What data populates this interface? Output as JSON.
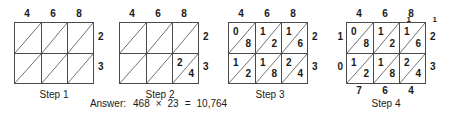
{
  "problem": {
    "multiplicand": "468",
    "multiplier": "23",
    "product": "10,764",
    "operator": "×",
    "equals": "="
  },
  "answer": {
    "label": "Answer:",
    "left": "468",
    "operator": "×",
    "right": "23",
    "equals": "=",
    "result": "10,764"
  },
  "steps": [
    {
      "caption": "Step 1",
      "top_digits": [
        "4",
        "6",
        "8"
      ],
      "right_digits": [
        "2",
        "3"
      ],
      "cells": [
        [
          {
            "upper": "",
            "lower": ""
          },
          {
            "upper": "",
            "lower": ""
          },
          {
            "upper": "",
            "lower": ""
          }
        ],
        [
          {
            "upper": "",
            "lower": ""
          },
          {
            "upper": "",
            "lower": ""
          },
          {
            "upper": "",
            "lower": ""
          }
        ]
      ],
      "left_sums": [],
      "bottom_sums": [],
      "corner_sums": []
    },
    {
      "caption": "Step 2",
      "top_digits": [
        "4",
        "6",
        "8"
      ],
      "right_digits": [
        "2",
        "3"
      ],
      "cells": [
        [
          {
            "upper": "",
            "lower": ""
          },
          {
            "upper": "",
            "lower": ""
          },
          {
            "upper": "",
            "lower": ""
          }
        ],
        [
          {
            "upper": "",
            "lower": ""
          },
          {
            "upper": "",
            "lower": ""
          },
          {
            "upper": "2",
            "lower": "4"
          }
        ]
      ],
      "left_sums": [],
      "bottom_sums": [],
      "corner_sums": []
    },
    {
      "caption": "Step 3",
      "top_digits": [
        "4",
        "6",
        "8"
      ],
      "right_digits": [
        "2",
        "3"
      ],
      "cells": [
        [
          {
            "upper": "0",
            "lower": "8"
          },
          {
            "upper": "1",
            "lower": "2"
          },
          {
            "upper": "1",
            "lower": "6"
          }
        ],
        [
          {
            "upper": "1",
            "lower": "2"
          },
          {
            "upper": "1",
            "lower": "8"
          },
          {
            "upper": "2",
            "lower": "4"
          }
        ]
      ],
      "left_sums": [],
      "bottom_sums": [],
      "corner_sums": []
    },
    {
      "caption": "Step 4",
      "top_digits": [
        "4",
        "6",
        "8"
      ],
      "right_digits": [
        "2",
        "3"
      ],
      "cells": [
        [
          {
            "upper": "0",
            "lower": "8"
          },
          {
            "upper": "1",
            "lower": "2"
          },
          {
            "upper": "1",
            "lower": "6"
          }
        ],
        [
          {
            "upper": "1",
            "lower": "2"
          },
          {
            "upper": "1",
            "lower": "8"
          },
          {
            "upper": "2",
            "lower": "4"
          }
        ]
      ],
      "left_sums": [
        "1",
        "0"
      ],
      "bottom_sums": [
        "7",
        "6",
        "4"
      ],
      "corner_sums": [
        "",
        "1",
        "1"
      ]
    }
  ],
  "colors": {
    "grid_line": "#4a4a4a",
    "diagonal_line": "#6e6e6e",
    "text": "#1a1a1a",
    "background": "#ffffff"
  }
}
